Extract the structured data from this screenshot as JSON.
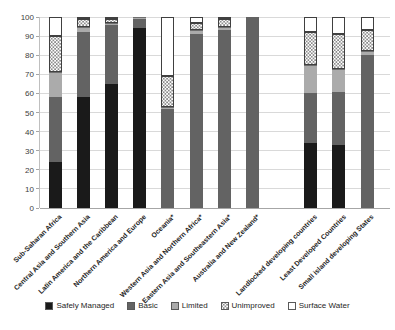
{
  "chart_data": {
    "type": "bar",
    "stacked": true,
    "title": "",
    "xlabel": "",
    "ylabel": "",
    "ylim": [
      0,
      100
    ],
    "ytick_step": 10,
    "grid": true,
    "legend_position": "bottom",
    "group_gap_after_index": 7,
    "categories": [
      "Sub-Saharan Africa",
      "Central Asia and Southern Asia",
      "Latin America and the Caribbean",
      "Northern America and Europe",
      "Oceania*",
      "Western Asia and Northern Africa*",
      "Eastern Asia and Southeastern Asia*",
      "Australia and New Zealand*",
      "Landlocked developing countries",
      "Least Developed Countries",
      "Small island developing States"
    ],
    "series": [
      {
        "name": "Safely Managed",
        "style": "safely",
        "color": "#1a1a1a",
        "values": [
          24,
          58,
          65,
          94,
          0,
          0,
          0,
          0,
          34,
          33,
          0
        ]
      },
      {
        "name": "Basic",
        "style": "basic",
        "color": "#636363",
        "values": [
          34,
          34,
          31,
          5,
          52,
          91,
          93,
          100,
          26,
          28,
          80
        ]
      },
      {
        "name": "Limited",
        "style": "limited",
        "color": "#ababab",
        "values": [
          13,
          3,
          1,
          1,
          1,
          2,
          2,
          0,
          15,
          12,
          2
        ]
      },
      {
        "name": "Unimproved",
        "style": "unimproved",
        "color": "dotted-pattern",
        "values": [
          19,
          4,
          2,
          0,
          16,
          4,
          4,
          0,
          17,
          18,
          11
        ]
      },
      {
        "name": "Surface Water",
        "style": "surface",
        "color": "#ffffff",
        "values": [
          10,
          1,
          1,
          0,
          31,
          3,
          1,
          0,
          8,
          9,
          7
        ]
      }
    ]
  }
}
